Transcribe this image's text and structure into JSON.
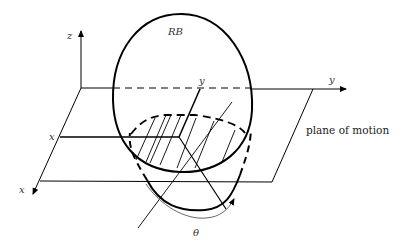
{
  "diagram": {
    "labels": {
      "rigid_body": "RB",
      "z_axis": "z",
      "y_axis_outer": "y",
      "y_axis_inner": "y",
      "x_axis_outer": "x",
      "x_axis_inner": "x",
      "angle": "θ",
      "plane": "plane of motion"
    },
    "colors": {
      "stroke": "#000000",
      "text": "#222222",
      "background": "#ffffff"
    }
  }
}
